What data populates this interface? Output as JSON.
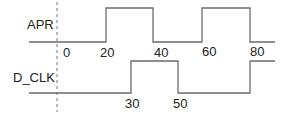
{
  "diagram": {
    "type": "timing-diagram",
    "signals": [
      {
        "name": "APR",
        "transitions_at": [
          20,
          40,
          60,
          80
        ],
        "initial": "low"
      },
      {
        "name": "D_CLK",
        "transitions_at": [
          30,
          50,
          80
        ],
        "initial": "low"
      }
    ],
    "labels": {
      "apr": "APR",
      "dclk": "D_CLK",
      "t0": "0",
      "t20": "20",
      "t40": "40",
      "t60": "60",
      "t80": "80",
      "t30": "30",
      "t50": "50"
    },
    "colors": {
      "line": "#6b6b6b",
      "text": "#222222"
    }
  }
}
